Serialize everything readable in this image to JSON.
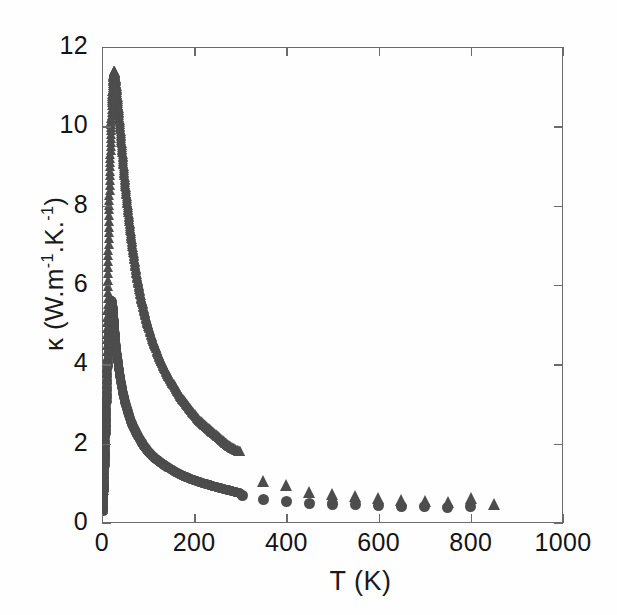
{
  "chart_data": {
    "type": "scatter",
    "title": "",
    "xlabel": "T (K)",
    "ylabel_parts": {
      "symbol": "κ",
      "open": " (W.m",
      "sup1": "-1",
      "mid": ".K.",
      "sup2": "-1",
      "close": ")"
    },
    "ylabel": "κ (W.m-1.K.-1)",
    "xlim": [
      0,
      1000
    ],
    "ylim": [
      0,
      12
    ],
    "xticks": [
      0,
      200,
      400,
      600,
      800,
      1000
    ],
    "yticks": [
      0,
      2,
      4,
      6,
      8,
      10,
      12
    ],
    "xtick_labels": [
      "0",
      "200",
      "400",
      "600",
      "800",
      "1000"
    ],
    "ytick_labels": [
      "0",
      "2",
      "4",
      "6",
      "8",
      "10",
      "12"
    ],
    "grid": false,
    "legend": "none",
    "marker_color": "#4d4d4d",
    "axis_color": "#6b6b6b",
    "series": [
      {
        "name": "triangle-series",
        "marker": "triangle",
        "peak_value": 11.4,
        "peak_temperature": 25,
        "points": [
          [
            2,
            0.35
          ],
          [
            4,
            0.9
          ],
          [
            6,
            1.7
          ],
          [
            8,
            2.7
          ],
          [
            10,
            3.9
          ],
          [
            12,
            5.2
          ],
          [
            14,
            6.6
          ],
          [
            16,
            7.9
          ],
          [
            18,
            9.0
          ],
          [
            20,
            9.9
          ],
          [
            22,
            10.6
          ],
          [
            24,
            11.1
          ],
          [
            26,
            11.4
          ],
          [
            28,
            11.35
          ],
          [
            30,
            11.2
          ],
          [
            33,
            10.9
          ],
          [
            36,
            10.5
          ],
          [
            39,
            10.1
          ],
          [
            42,
            9.7
          ],
          [
            45,
            9.3
          ],
          [
            48,
            8.9
          ],
          [
            51,
            8.5
          ],
          [
            55,
            8.1
          ],
          [
            59,
            7.7
          ],
          [
            63,
            7.3
          ],
          [
            67,
            6.95
          ],
          [
            71,
            6.6
          ],
          [
            75,
            6.3
          ],
          [
            80,
            6.0
          ],
          [
            85,
            5.7
          ],
          [
            90,
            5.45
          ],
          [
            95,
            5.2
          ],
          [
            100,
            5.0
          ],
          [
            108,
            4.7
          ],
          [
            116,
            4.45
          ],
          [
            124,
            4.2
          ],
          [
            132,
            4.0
          ],
          [
            140,
            3.8
          ],
          [
            150,
            3.6
          ],
          [
            160,
            3.4
          ],
          [
            170,
            3.2
          ],
          [
            180,
            3.05
          ],
          [
            190,
            2.9
          ],
          [
            200,
            2.75
          ],
          [
            210,
            2.6
          ],
          [
            220,
            2.5
          ],
          [
            230,
            2.4
          ],
          [
            240,
            2.3
          ],
          [
            250,
            2.2
          ],
          [
            260,
            2.1
          ],
          [
            270,
            2.0
          ],
          [
            280,
            1.92
          ],
          [
            290,
            1.85
          ],
          [
            300,
            1.8
          ]
        ],
        "high_temperature_points": [
          [
            350,
            1.05
          ],
          [
            400,
            0.95
          ],
          [
            450,
            0.78
          ],
          [
            500,
            0.72
          ],
          [
            550,
            0.68
          ],
          [
            600,
            0.62
          ],
          [
            650,
            0.58
          ],
          [
            700,
            0.55
          ],
          [
            750,
            0.52
          ],
          [
            800,
            0.62
          ],
          [
            850,
            0.48
          ]
        ]
      },
      {
        "name": "circle-series",
        "marker": "circle",
        "peak_value": 5.6,
        "peak_temperature": 20,
        "points": [
          [
            2,
            0.3
          ],
          [
            4,
            0.75
          ],
          [
            6,
            1.3
          ],
          [
            8,
            2.0
          ],
          [
            10,
            2.8
          ],
          [
            12,
            3.6
          ],
          [
            14,
            4.4
          ],
          [
            16,
            5.0
          ],
          [
            18,
            5.4
          ],
          [
            20,
            5.6
          ],
          [
            22,
            5.55
          ],
          [
            24,
            5.4
          ],
          [
            26,
            5.1
          ],
          [
            28,
            4.8
          ],
          [
            30,
            4.5
          ],
          [
            33,
            4.2
          ],
          [
            36,
            3.95
          ],
          [
            39,
            3.7
          ],
          [
            42,
            3.5
          ],
          [
            45,
            3.3
          ],
          [
            48,
            3.15
          ],
          [
            51,
            3.0
          ],
          [
            55,
            2.85
          ],
          [
            59,
            2.7
          ],
          [
            63,
            2.55
          ],
          [
            67,
            2.45
          ],
          [
            71,
            2.35
          ],
          [
            75,
            2.25
          ],
          [
            80,
            2.15
          ],
          [
            85,
            2.05
          ],
          [
            90,
            1.95
          ],
          [
            95,
            1.88
          ],
          [
            100,
            1.8
          ],
          [
            108,
            1.7
          ],
          [
            116,
            1.62
          ],
          [
            124,
            1.55
          ],
          [
            132,
            1.48
          ],
          [
            140,
            1.42
          ],
          [
            150,
            1.35
          ],
          [
            160,
            1.28
          ],
          [
            170,
            1.22
          ],
          [
            180,
            1.17
          ],
          [
            190,
            1.12
          ],
          [
            200,
            1.08
          ],
          [
            210,
            1.04
          ],
          [
            220,
            1.0
          ],
          [
            230,
            0.97
          ],
          [
            240,
            0.93
          ],
          [
            250,
            0.9
          ],
          [
            260,
            0.87
          ],
          [
            270,
            0.84
          ],
          [
            280,
            0.81
          ],
          [
            290,
            0.78
          ],
          [
            300,
            0.75
          ]
        ],
        "high_temperature_points": [
          [
            305,
            0.7
          ],
          [
            350,
            0.6
          ],
          [
            400,
            0.55
          ],
          [
            450,
            0.5
          ],
          [
            500,
            0.48
          ],
          [
            550,
            0.46
          ],
          [
            600,
            0.44
          ],
          [
            650,
            0.42
          ],
          [
            700,
            0.41
          ],
          [
            750,
            0.4
          ],
          [
            800,
            0.42
          ]
        ]
      }
    ]
  }
}
